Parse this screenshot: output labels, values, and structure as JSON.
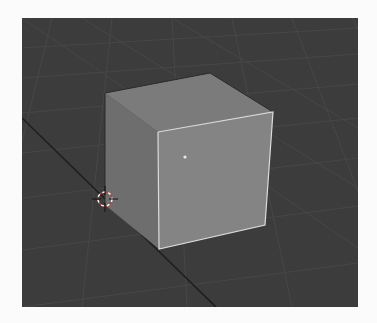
{
  "app": "3D viewport",
  "viewport": {
    "background_color": "#3c3c3c",
    "grid_color": "#464646",
    "axis_line_color": "#1e1e1e"
  },
  "scene": {
    "objects": [
      {
        "name": "cube",
        "selected": true,
        "face_colors": {
          "top": "#7b7b7b",
          "left": "#6e6e6e",
          "front": "#848484"
        },
        "outline_color": "#d8d8d8",
        "origin_dot_color": "#e8e8e8"
      }
    ],
    "cursor_3d": {
      "icon": "3d-cursor-icon",
      "ring_colors": [
        "#ffffff",
        "#c43a3a"
      ]
    }
  }
}
